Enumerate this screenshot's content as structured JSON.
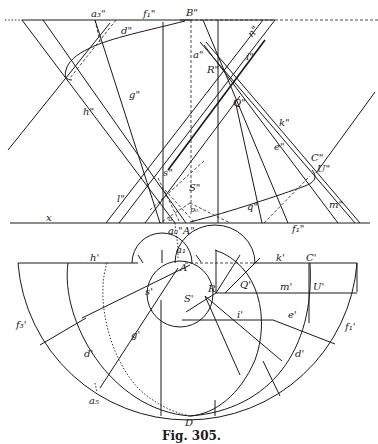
{
  "figure": {
    "caption": "Fig. 305.",
    "elevation_labels": {
      "a3": "a₃\"",
      "f1_top": "f₁\"",
      "B": "B\"",
      "d": "d\"",
      "n": "n\"",
      "a": "a\"",
      "i": "i\"",
      "R": "R\"",
      "g": "g\"",
      "h": "h\"",
      "Q": "Q\"",
      "k": "k\"",
      "e": "e\"",
      "C": "C\"",
      "U": "U\"",
      "s": "s\"",
      "S": "S\"",
      "p": "p₀",
      "l": "l\"",
      "x": "x",
      "q": "q\"",
      "m": "m\"",
      "f1_bottom": "f₁\"",
      "a0": "a₀\"",
      "A": "A\"",
      "u": "u"
    },
    "plan_labels": {
      "a1": "a₁",
      "A": "A",
      "h": "h'",
      "k": "k'",
      "C": "C'",
      "s": "s'",
      "S": "S'",
      "R": "R",
      "Q": "Q'",
      "m": "m'",
      "U": "U'",
      "i": "i'",
      "e": "e'",
      "f3": "f₃'",
      "f1": "f₁'",
      "g": "g'",
      "d_left": "d'",
      "d_right": "d'",
      "a5": "a₅",
      "D": "D"
    }
  }
}
